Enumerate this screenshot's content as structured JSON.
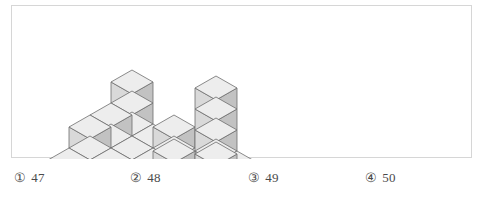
{
  "page": {
    "background_color": "#ffffff",
    "text_color": "#4a4a4a"
  },
  "figure": {
    "frame_border_color": "#d6d6d6",
    "caption": "",
    "cube_colors": {
      "top": "#ededed",
      "left": "#d9d9d9",
      "right": "#c2c2c2",
      "edge": "#6d6d6d"
    },
    "projection": {
      "origin_x": 120,
      "origin_y": 118,
      "cube_width": 21,
      "cube_height_step": 12,
      "cube_rise": 21
    },
    "height_map": {
      "note": "rows are depth (back to front), columns left to right; value = number of stacked cubes",
      "grid": [
        [
          3,
          1,
          2,
          1,
          5,
          2
        ],
        [
          2,
          1,
          1,
          2,
          1,
          3
        ],
        [
          2,
          1,
          1,
          1,
          1,
          2
        ],
        [
          1,
          0,
          1,
          0,
          1,
          1
        ]
      ]
    }
  },
  "choices": {
    "items": [
      {
        "marker": "①",
        "value": "47"
      },
      {
        "marker": "②",
        "value": "48"
      },
      {
        "marker": "③",
        "value": "49"
      },
      {
        "marker": "④",
        "value": "50"
      }
    ]
  }
}
